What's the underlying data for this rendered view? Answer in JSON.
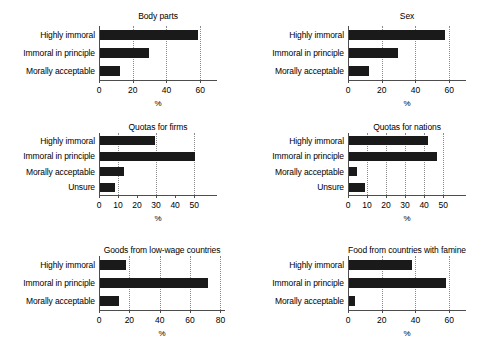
{
  "figure": {
    "background": "#ffffff",
    "bar_color": "#1a1a1a",
    "axis_color": "#4d4d4d",
    "grid_color": "#8a8a8a",
    "xlabel": "%"
  },
  "chart_data": [
    {
      "type": "bar",
      "orientation": "horizontal",
      "title": "Body parts",
      "categories": [
        "Highly immoral",
        "Immoral in principle",
        "Morally acceptable"
      ],
      "values": [
        58,
        29,
        12
      ],
      "xlabel": "%",
      "ylabel": "",
      "xlim": [
        0,
        70
      ],
      "xticks": [
        0,
        20,
        40,
        60
      ],
      "gridlines": [
        20,
        40,
        60
      ],
      "grid": true,
      "legend": "none"
    },
    {
      "type": "bar",
      "orientation": "horizontal",
      "title": "Sex",
      "categories": [
        "Highly immoral",
        "Immoral in principle",
        "Morally acceptable"
      ],
      "values": [
        57,
        29,
        12
      ],
      "xlabel": "%",
      "ylabel": "",
      "xlim": [
        0,
        70
      ],
      "xticks": [
        0,
        20,
        40,
        60
      ],
      "gridlines": [
        20,
        40,
        60
      ],
      "grid": true,
      "legend": "none"
    },
    {
      "type": "bar",
      "orientation": "horizontal",
      "title": "Quotas for firms",
      "categories": [
        "Highly immoral",
        "Immoral in principle",
        "Morally acceptable",
        "Unsure"
      ],
      "values": [
        29,
        50,
        12.5,
        8
      ],
      "xlabel": "%",
      "ylabel": "",
      "xlim": [
        0,
        62
      ],
      "xticks": [
        0,
        10,
        20,
        30,
        40,
        50
      ],
      "gridlines": [
        10,
        30,
        50
      ],
      "grid": true,
      "legend": "none"
    },
    {
      "type": "bar",
      "orientation": "horizontal",
      "title": "Quotas for nations",
      "categories": [
        "Highly immoral",
        "Immoral in principle",
        "Morally acceptable",
        "Unsure"
      ],
      "values": [
        41.5,
        46,
        4,
        8.5
      ],
      "xlabel": "%",
      "ylabel": "",
      "xlim": [
        0,
        62
      ],
      "xticks": [
        0,
        10,
        20,
        30,
        40,
        50
      ],
      "gridlines": [
        10,
        20,
        30,
        40,
        50
      ],
      "grid": true,
      "legend": "none"
    },
    {
      "type": "bar",
      "orientation": "horizontal",
      "title": "Goods from low-wage countries",
      "categories": [
        "Highly immoral",
        "Immoral in principle",
        "Morally acceptable"
      ],
      "values": [
        17,
        71,
        12.5
      ],
      "xlabel": "%",
      "ylabel": "",
      "xlim": [
        0,
        83
      ],
      "xticks": [
        0,
        20,
        40,
        60,
        80
      ],
      "gridlines": [
        20,
        40,
        60,
        80
      ],
      "grid": true,
      "legend": "none"
    },
    {
      "type": "bar",
      "orientation": "horizontal",
      "title": "Food from countries with famine",
      "categories": [
        "Highly immoral",
        "Immoral in principle",
        "Morally acceptable"
      ],
      "values": [
        37.5,
        57.5,
        3.5
      ],
      "xlabel": "%",
      "ylabel": "",
      "xlim": [
        0,
        70
      ],
      "xticks": [
        0,
        20,
        40,
        60
      ],
      "gridlines": [
        20,
        40,
        60
      ],
      "grid": true,
      "legend": "none"
    }
  ]
}
